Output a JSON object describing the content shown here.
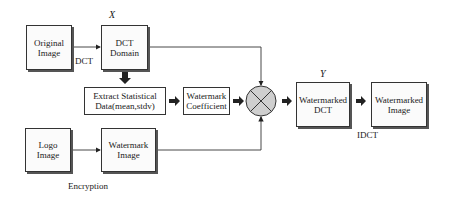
{
  "diagram": {
    "colors": {
      "line": "#333333",
      "box_fill": "#fbfbfb",
      "shadow": "#555555",
      "combiner_fill": "#cfcfcf"
    },
    "nodes": {
      "original_image": {
        "label": "Original\nImage"
      },
      "dct_domain": {
        "label": "DCT\nDomain",
        "variable": "X"
      },
      "extract_stats": {
        "label": "Extract Statistical\nData(mean,stdv)"
      },
      "watermark_coefficient": {
        "label": "Watermark\nCoefficient"
      },
      "combiner": {
        "symbol": "⊗"
      },
      "watermarked_dct": {
        "label": "Watermarked\nDCT",
        "variable": "Y"
      },
      "watermarked_image": {
        "label": "Watermarked\nImage"
      },
      "logo_image": {
        "label": "Logo\nImage"
      },
      "watermark_image": {
        "label": "Watermark\nImage"
      }
    },
    "edge_labels": {
      "dct": "DCT",
      "idct": "IDCT",
      "encryption": "Encryption"
    },
    "edges": [
      {
        "from": "original_image",
        "to": "dct_domain",
        "label": "DCT"
      },
      {
        "from": "dct_domain",
        "to": "combiner"
      },
      {
        "from": "dct_domain",
        "to": "extract_stats"
      },
      {
        "from": "extract_stats",
        "to": "watermark_coefficient"
      },
      {
        "from": "watermark_coefficient",
        "to": "combiner"
      },
      {
        "from": "logo_image",
        "to": "watermark_image",
        "label": "Encryption"
      },
      {
        "from": "watermark_image",
        "to": "combiner"
      },
      {
        "from": "combiner",
        "to": "watermarked_dct"
      },
      {
        "from": "watermarked_dct",
        "to": "watermarked_image",
        "label": "IDCT"
      }
    ]
  }
}
